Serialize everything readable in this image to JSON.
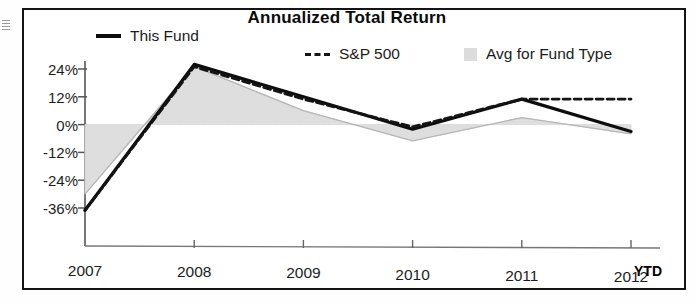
{
  "chart_data": {
    "type": "line",
    "title": "Annualized Total Return",
    "xlabel": "",
    "ylabel": "",
    "x": [
      "2007",
      "2008",
      "2009",
      "2010",
      "2011",
      "2012"
    ],
    "x_suffix_label": "YTD",
    "ytick_labels": [
      "24%",
      "12%",
      "0%",
      "-12%",
      "-24%",
      "-36%"
    ],
    "ytick_values": [
      24,
      12,
      0,
      -12,
      -24,
      -36
    ],
    "ylim": [
      -38,
      28
    ],
    "grid": false,
    "zero_line": true,
    "legend_position": "top",
    "series": [
      {
        "name": "This Fund",
        "style": "solid",
        "color": "#0d0d0d",
        "values": [
          -37,
          26,
          12,
          -2,
          11,
          -3
        ]
      },
      {
        "name": "S&P 500",
        "style": "dashed",
        "color": "#141414",
        "values": [
          -37,
          25,
          11,
          -1,
          11,
          11
        ]
      },
      {
        "name": "Avg for Fund Type",
        "style": "area",
        "color": "#dcdcdc",
        "values": [
          -30,
          25,
          6,
          -7,
          3,
          -4
        ]
      }
    ]
  },
  "legend": {
    "items": [
      {
        "label": "This Fund",
        "marker": "line-solid-icon"
      },
      {
        "label": "S&P 500",
        "marker": "line-dashed-icon"
      },
      {
        "label": "Avg for Fund Type",
        "marker": "area-swatch-icon"
      }
    ]
  }
}
